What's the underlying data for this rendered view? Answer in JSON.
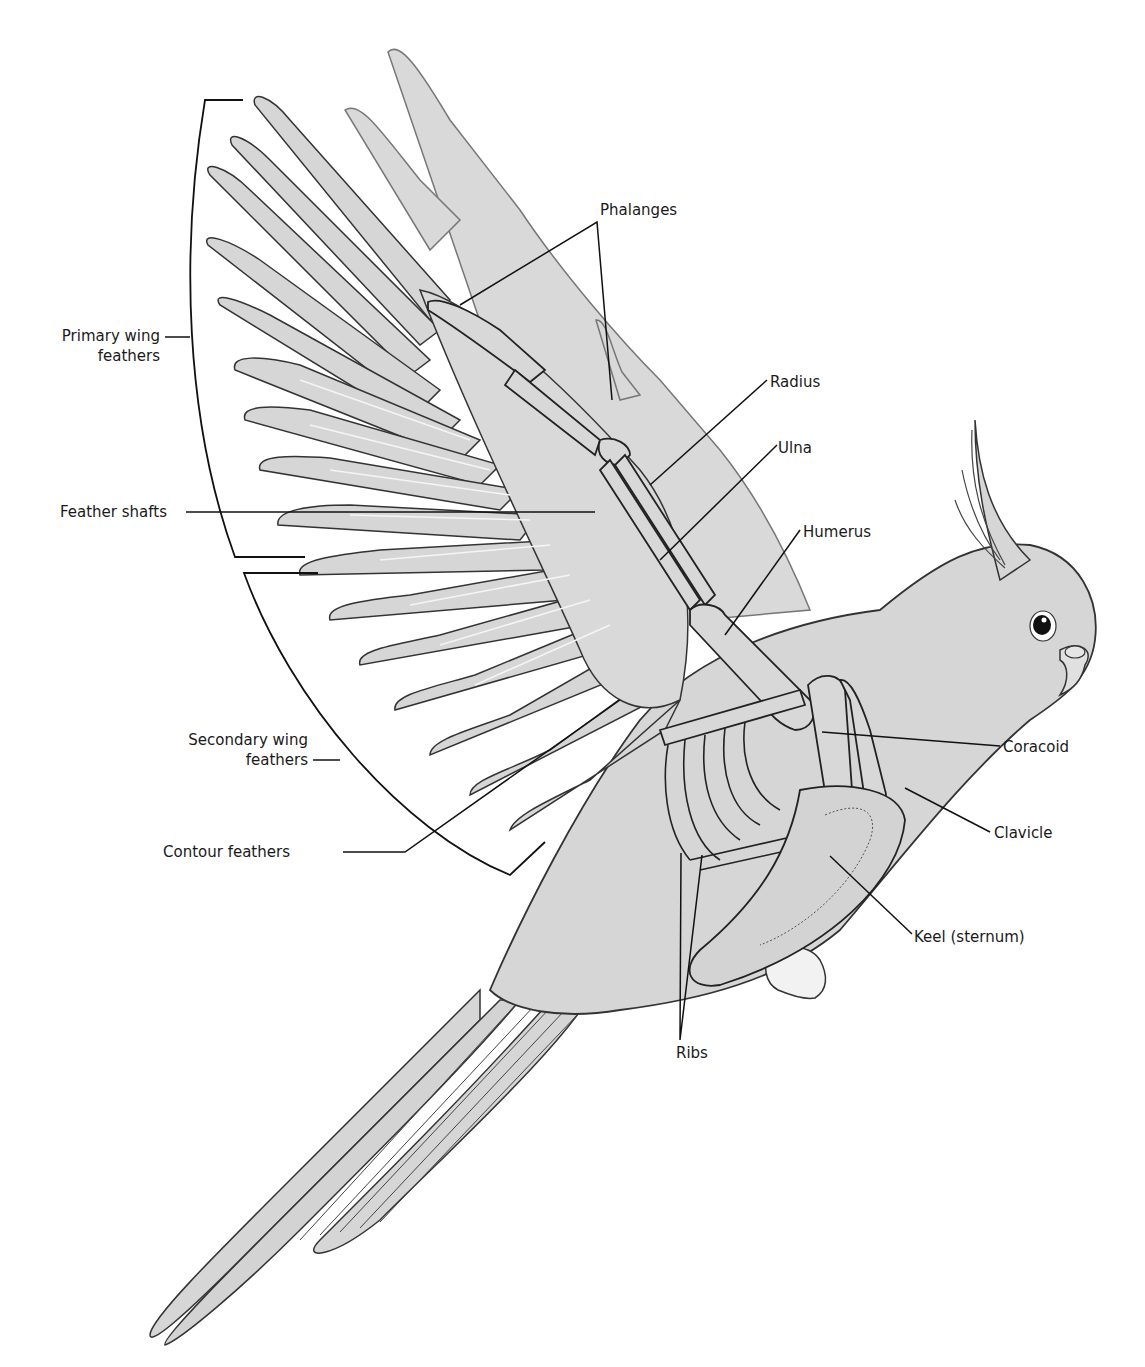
{
  "diagram": {
    "colors": {
      "body_fill": "#d6d6d6",
      "shadow_fill": "#cfcfcf",
      "outline": "#222222",
      "bone_fill": "#d8d8d8",
      "leader_line": "#1a1a1a",
      "background": "#ffffff"
    },
    "labels": {
      "primary_wing_feathers": {
        "line1": "Primary wing",
        "line2": "feathers"
      },
      "feather_shafts": "Feather shafts",
      "secondary_wing_feathers": {
        "line1": "Secondary wing",
        "line2": "feathers"
      },
      "contour_feathers": "Contour feathers",
      "phalanges": "Phalanges",
      "radius": "Radius",
      "ulna": "Ulna",
      "humerus": "Humerus",
      "coracoid": "Coracoid",
      "clavicle": "Clavicle",
      "keel": "Keel (sternum)",
      "ribs": "Ribs"
    }
  }
}
